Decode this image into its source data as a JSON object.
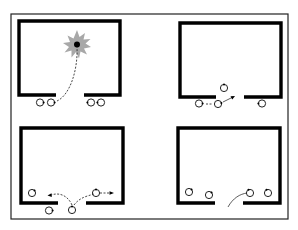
{
  "diagram": {
    "colors": {
      "wall": "#000000",
      "frame": "#222222",
      "burst": "#a8a8a8",
      "person_fill": "#ffffff",
      "path": "#333333"
    },
    "panels": [
      {
        "id": "top-left",
        "features": [
          "explosion-burst",
          "dashed-path-to-burst"
        ],
        "people_count": 4
      },
      {
        "id": "top-right",
        "features": [
          "entry-arrow"
        ],
        "people_count": 4
      },
      {
        "id": "bottom-left",
        "features": [
          "split-movement-arrows"
        ],
        "people_count": 4
      },
      {
        "id": "bottom-right",
        "features": [
          "curved-path-into-room"
        ],
        "people_count": 4
      }
    ]
  }
}
